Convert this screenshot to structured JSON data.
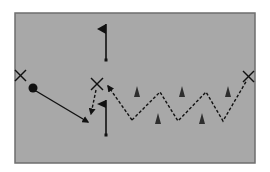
{
  "diagram": {
    "type": "soccer-drill",
    "colors": {
      "background": "#ffffff",
      "field": "#a8a8a8",
      "field_border": "#6e6e6e",
      "ink": "#111111",
      "cone": "#2e2e2e"
    },
    "field": {
      "x": 15,
      "y": 13,
      "width": 240,
      "height": 150
    },
    "players": [
      {
        "id": "player-left",
        "x": 20,
        "y": 75
      },
      {
        "id": "player-center",
        "x": 97,
        "y": 84
      },
      {
        "id": "player-right",
        "x": 248,
        "y": 76
      }
    ],
    "ball": {
      "x": 33,
      "y": 88,
      "r": 4.5
    },
    "flags": [
      {
        "id": "flag-top",
        "pole_x": 106,
        "top_y": 24,
        "bottom_y": 60
      },
      {
        "id": "flag-middle",
        "pole_x": 106,
        "top_y": 100,
        "bottom_y": 135
      }
    ],
    "cones": [
      {
        "x": 137,
        "y": 92
      },
      {
        "x": 158,
        "y": 119
      },
      {
        "x": 182,
        "y": 92
      },
      {
        "x": 202,
        "y": 119
      },
      {
        "x": 228,
        "y": 92
      }
    ],
    "pass_arrow": {
      "from": [
        36,
        91
      ],
      "to": [
        88,
        122
      ],
      "style": "solid"
    },
    "run_arrow": {
      "from": [
        96,
        90
      ],
      "to": [
        91,
        114
      ],
      "style": "dashed"
    },
    "dribble_return_arrow": {
      "from": [
        132,
        120
      ],
      "to": [
        108,
        86
      ],
      "style": "dashed"
    },
    "zigzag": {
      "points": "132,120 160,92 178,121 206,92 223,121 247,80",
      "style": "dashed"
    }
  }
}
